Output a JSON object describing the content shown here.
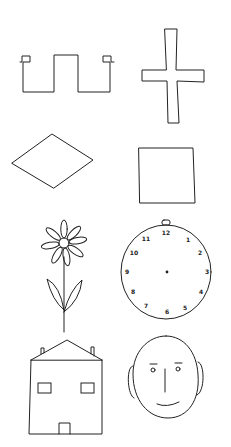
{
  "figure": {
    "ink_color": "#222222",
    "background_color": "#ffffff",
    "rows": [
      {
        "left": "open-square-wave-shape",
        "right": "cross"
      },
      {
        "left": "diamond",
        "right": "square"
      },
      {
        "left": "flower",
        "right": "clock"
      },
      {
        "left": "house",
        "right": "face"
      }
    ],
    "clock": {
      "numbers": [
        "12",
        "1",
        "2",
        "3",
        "4",
        "5",
        "6",
        "7",
        "8",
        "9",
        "10",
        "11"
      ]
    }
  }
}
